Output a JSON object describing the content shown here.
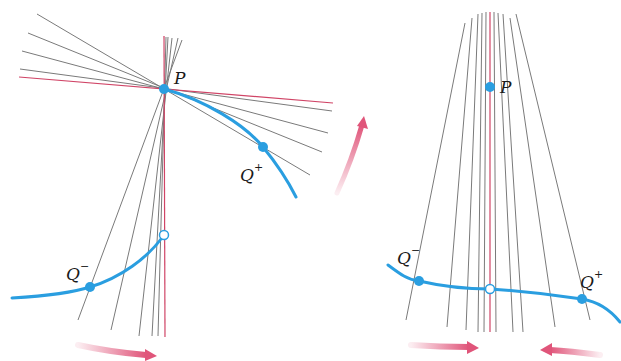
{
  "figure": {
    "colors": {
      "curve": "#2a9ee0",
      "tangent": "#d04466",
      "secant": "#777777",
      "arrow": "#e0557a",
      "point": "#2a9ee0"
    },
    "left_panel": {
      "labels": {
        "P": "P",
        "Q_plus": "Q",
        "Q_plus_sup": "+",
        "Q_minus": "Q",
        "Q_minus_sup": "−"
      }
    },
    "right_panel": {
      "labels": {
        "P": "P",
        "Q_plus": "Q",
        "Q_plus_sup": "+",
        "Q_minus": "Q",
        "Q_minus_sup": "−"
      }
    }
  }
}
